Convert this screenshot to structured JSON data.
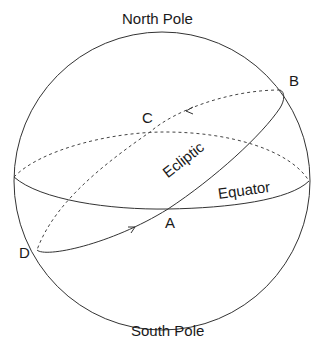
{
  "labels": {
    "north_pole": "North Pole",
    "south_pole": "South Pole",
    "ecliptic": "Ecliptic",
    "equator": "Equator",
    "point_a": "A",
    "point_b": "B",
    "point_c": "C",
    "point_d": "D"
  },
  "colors": {
    "stroke": "#333333",
    "background": "#ffffff"
  }
}
